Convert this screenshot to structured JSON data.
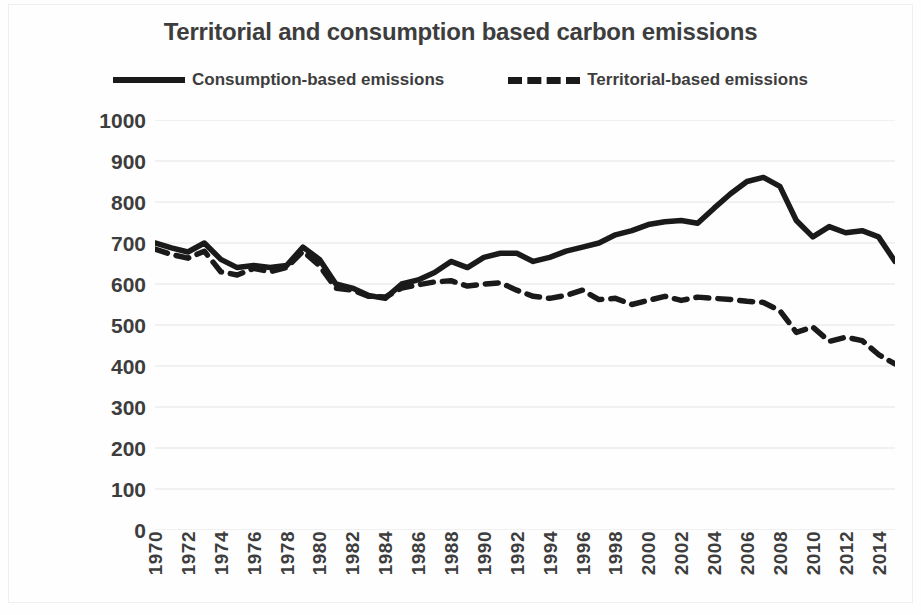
{
  "chart_data": {
    "type": "line",
    "title": "Territorial and consumption based carbon emissions",
    "xlabel": "",
    "ylabel": "Emissions Mt CO2",
    "ylim": [
      0,
      1000
    ],
    "xlim": [
      1970,
      2015
    ],
    "grid": true,
    "legend_position": "top",
    "y_ticks": [
      1000,
      900,
      800,
      700,
      600,
      500,
      400,
      300,
      200,
      100,
      0
    ],
    "x_ticks": [
      1970,
      1972,
      1974,
      1976,
      1978,
      1980,
      1982,
      1984,
      1986,
      1988,
      1990,
      1992,
      1994,
      1996,
      1998,
      2000,
      2002,
      2004,
      2006,
      2008,
      2010,
      2012,
      2014
    ],
    "x": [
      1970,
      1971,
      1972,
      1973,
      1974,
      1975,
      1976,
      1977,
      1978,
      1979,
      1980,
      1981,
      1982,
      1983,
      1984,
      1985,
      1986,
      1987,
      1988,
      1989,
      1990,
      1991,
      1992,
      1993,
      1994,
      1995,
      1996,
      1997,
      1998,
      1999,
      2000,
      2001,
      2002,
      2003,
      2004,
      2005,
      2006,
      2007,
      2008,
      2009,
      2010,
      2011,
      2012,
      2013,
      2014,
      2015
    ],
    "series": [
      {
        "name": "Consumption-based emissions",
        "style": "solid",
        "color": "#1a1a1a",
        "values": [
          700,
          688,
          678,
          700,
          660,
          640,
          645,
          640,
          645,
          690,
          660,
          600,
          590,
          572,
          565,
          600,
          610,
          628,
          655,
          640,
          665,
          675,
          675,
          655,
          665,
          680,
          690,
          700,
          720,
          730,
          745,
          752,
          755,
          748,
          785,
          820,
          850,
          860,
          838,
          755,
          715,
          740,
          725,
          730,
          715,
          655
        ]
      },
      {
        "name": "Territorial-based emissions",
        "style": "dashed",
        "color": "#1a1a1a",
        "values": [
          685,
          672,
          663,
          680,
          630,
          622,
          638,
          630,
          640,
          680,
          645,
          590,
          585,
          570,
          568,
          590,
          598,
          605,
          608,
          595,
          600,
          603,
          585,
          570,
          565,
          572,
          585,
          562,
          565,
          550,
          560,
          570,
          560,
          568,
          565,
          562,
          558,
          555,
          535,
          482,
          495,
          460,
          470,
          462,
          428,
          405
        ]
      }
    ]
  },
  "legend": {
    "entries": [
      {
        "label": "Consumption-based emissions",
        "style": "solid"
      },
      {
        "label": "Territorial-based emissions",
        "style": "dashed"
      }
    ]
  },
  "colors": {
    "line": "#1a1a1a",
    "text": "#3d3d3d",
    "grid": "#e4e4e4",
    "background": "#fefefe"
  }
}
